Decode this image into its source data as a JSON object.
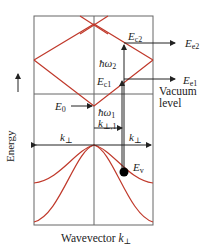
{
  "diagram": {
    "axis": {
      "y_label": "Energy",
      "x_label": "Wavevector",
      "x_symbol": "k",
      "x_subscript": "⊥"
    },
    "labels": {
      "ec2_inner": {
        "sym": "E",
        "sub": "c2"
      },
      "ec2_outer": {
        "sym": "E",
        "sub": "e2"
      },
      "ec1_inner": {
        "sym": "E",
        "sub": "c1"
      },
      "ec1_outer": {
        "sym": "E",
        "sub": "e1"
      },
      "e0": {
        "sym": "E",
        "sub": "0"
      },
      "ev": {
        "sym": "E",
        "sub": "v"
      },
      "hw2": {
        "sym": "ħω",
        "sub": "2"
      },
      "hw1": {
        "sym": "ħω",
        "sub": "1"
      },
      "k_perp1": {
        "sym": "k",
        "sub": "⊥,1"
      },
      "k_perp_left": {
        "sym": "k",
        "sub": "⊥"
      },
      "k_perp_right": {
        "sym": "k",
        "sub": "⊥"
      },
      "vacuum_line1": "Vacuum",
      "vacuum_line2": "level"
    },
    "colors": {
      "band": "#c0392b",
      "frame": "#555555",
      "arrow": "#222222"
    }
  }
}
